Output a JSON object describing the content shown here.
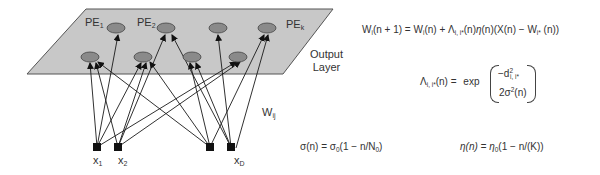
{
  "figure": {
    "plane_label_line1": "Output",
    "plane_label_line2": "Layer",
    "weights_label": "W",
    "weights_sub": "ij",
    "pe_labels": [
      {
        "base": "PE",
        "sub": "1"
      },
      {
        "base": "PE",
        "sub": "2"
      },
      {
        "base": "PE",
        "sub": "k"
      }
    ],
    "input_labels": [
      {
        "base": "x",
        "sub": "1"
      },
      {
        "base": "x",
        "sub": "2"
      },
      {
        "base": "x",
        "sub": "D"
      }
    ],
    "colors": {
      "plane_fill": "#c8c8c8",
      "plane_stroke": "#555555",
      "node_fill": "#8a8a8a",
      "node_stroke": "#444444",
      "input_fill": "#111111",
      "edge": "#1a1a1a"
    }
  },
  "equations": {
    "update": {
      "lhs_W": "W",
      "lhs_sub": "i",
      "lhs_rest": "(n + 1) = ",
      "r1_W": "W",
      "r1_sub": "i",
      "r1_rest": "(n) + ",
      "lambda": "Λ",
      "lambda_sub": "i, i*",
      "r2": "(n)",
      "eta": "η",
      "r3": "(n)(X(n) − ",
      "r4_W": "W",
      "r4_sub": "i*",
      "r4_rest": " (n))"
    },
    "neighborhood": {
      "lambda": "Λ",
      "lambda_sub": "i, i*",
      "lhs_rest": "(n) = ",
      "func": "exp",
      "numerator": "−d",
      "numerator_sup": "2",
      "numerator_sub": "i, i*",
      "denominator": "2σ",
      "denominator_sup": "2",
      "denominator_rest": "(n)"
    },
    "sigma": {
      "lhs": "σ(n) = σ",
      "sub0": "0",
      "mid": "(1 − n/N",
      "sub1": "0",
      "end": ")"
    },
    "eta": {
      "lhs": "η(n) = η",
      "sub0": "0",
      "rest": "(1 − n/(K))"
    }
  }
}
